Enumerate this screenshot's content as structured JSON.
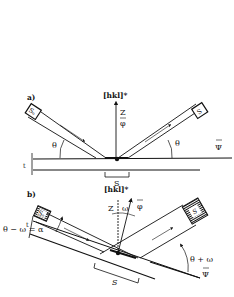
{
  "figure": {
    "panel_a": {
      "label": "a)",
      "normal_label": "[hkl]*",
      "z_label": "Z",
      "phi_label": "φ",
      "theta_left": "θ",
      "theta_right": "θ",
      "psi_label": "Ψ",
      "t_label": "t",
      "s_label": "S",
      "source_box": "Sₒ",
      "detector_box": "S"
    },
    "panel_b": {
      "label": "b)",
      "normal_label": "[hkl]*",
      "z_label": "Z",
      "omega_label": "ω",
      "phi_label": "φ",
      "alpha_eq": "θ − ω = α",
      "theta_plus_omega": "θ + ω",
      "psi_label": "Ψ",
      "t_label": "t",
      "s_label": "S",
      "source_box": "Sₒ",
      "detector_box": "S"
    },
    "colors": {
      "ink": "#111111",
      "background": "#ffffff"
    }
  }
}
